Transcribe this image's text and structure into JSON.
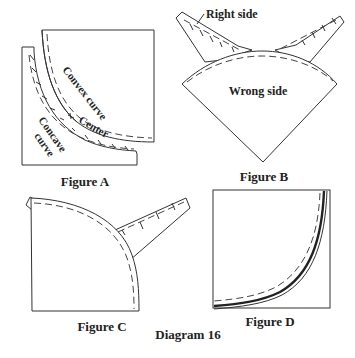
{
  "diagram": {
    "title": "Diagram 16",
    "colors": {
      "ink": "#333333",
      "background": "#ffffff"
    },
    "figures": [
      {
        "id": "A",
        "caption": "Figure A",
        "labels": {
          "convex": "Convex curve",
          "center": "Center",
          "concave_1": "Concave",
          "concave_2": "curve"
        }
      },
      {
        "id": "B",
        "caption": "Figure B",
        "labels": {
          "right_side": "Right side",
          "wrong_side": "Wrong side"
        }
      },
      {
        "id": "C",
        "caption": "Figure C",
        "labels": {}
      },
      {
        "id": "D",
        "caption": "Figure D",
        "labels": {}
      }
    ]
  }
}
